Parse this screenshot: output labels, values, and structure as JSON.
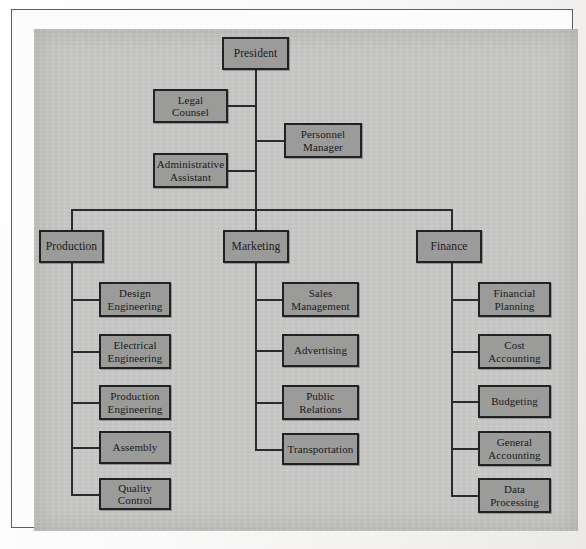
{
  "figure": {
    "kind": "organization-chart",
    "colors": {
      "page": "#f7f6f4",
      "frame_rule": "#5d5e60",
      "chart_field": "#c5c5c3",
      "node_fill": "#9b9b99",
      "node_border": "#222224",
      "connector": "#2b2b2d",
      "text": "#1a1a1c"
    }
  },
  "nodes": {
    "president": {
      "label": "President",
      "x": 221,
      "y": 36,
      "w": 67,
      "h": 33
    },
    "legal_counsel": {
      "label": "Legal\nCounsel",
      "x": 152,
      "y": 88,
      "w": 75,
      "h": 34
    },
    "personnel_manager": {
      "label": "Personnel\nManager",
      "x": 283,
      "y": 122,
      "w": 78,
      "h": 35
    },
    "administrative_assistant": {
      "label": "Administrative\nAssistant",
      "x": 152,
      "y": 152,
      "w": 75,
      "h": 35
    },
    "production": {
      "label": "Production",
      "x": 38,
      "y": 229,
      "w": 65,
      "h": 33
    },
    "marketing": {
      "label": "Marketing",
      "x": 222,
      "y": 229,
      "w": 66,
      "h": 33
    },
    "finance": {
      "label": "Finance",
      "x": 415,
      "y": 229,
      "w": 66,
      "h": 33
    },
    "design_engineering": {
      "label": "Design\nEngineering",
      "x": 98,
      "y": 281,
      "w": 72,
      "h": 35
    },
    "electrical_engineering": {
      "label": "Electrical\nEngineering",
      "x": 98,
      "y": 333,
      "w": 72,
      "h": 35
    },
    "production_engineering": {
      "label": "Production\nEngineering",
      "x": 98,
      "y": 384,
      "w": 72,
      "h": 35
    },
    "assembly": {
      "label": "Assembly",
      "x": 98,
      "y": 430,
      "w": 72,
      "h": 33
    },
    "quality_control": {
      "label": "Quality Control",
      "x": 98,
      "y": 477,
      "w": 72,
      "h": 32
    },
    "sales_management": {
      "label": "Sales\nManagement",
      "x": 281,
      "y": 281,
      "w": 77,
      "h": 35
    },
    "advertising": {
      "label": "Advertising",
      "x": 281,
      "y": 333,
      "w": 77,
      "h": 33
    },
    "public_relations": {
      "label": "Public\nRelations",
      "x": 281,
      "y": 384,
      "w": 77,
      "h": 35
    },
    "transportation": {
      "label": "Transportation",
      "x": 281,
      "y": 432,
      "w": 77,
      "h": 32
    },
    "financial_planning": {
      "label": "Financial\nPlanning",
      "x": 477,
      "y": 281,
      "w": 73,
      "h": 35
    },
    "cost_accounting": {
      "label": "Cost\nAccounting",
      "x": 477,
      "y": 333,
      "w": 73,
      "h": 35
    },
    "budgeting": {
      "label": "Budgeting",
      "x": 477,
      "y": 384,
      "w": 73,
      "h": 33
    },
    "general_accounting": {
      "label": "General\nAccounting",
      "x": 477,
      "y": 430,
      "w": 73,
      "h": 35
    },
    "data_processing": {
      "label": "Data\nProcessing",
      "x": 477,
      "y": 477,
      "w": 73,
      "h": 35
    }
  },
  "chart_data": {
    "type": "diagram",
    "diagram_type": "organization-chart",
    "title": "",
    "root": "President",
    "staff_positions": [
      "Legal Counsel",
      "Personnel Manager",
      "Administrative Assistant"
    ],
    "divisions": [
      {
        "name": "Production",
        "units": [
          "Design Engineering",
          "Electrical Engineering",
          "Production Engineering",
          "Assembly",
          "Quality Control"
        ]
      },
      {
        "name": "Marketing",
        "units": [
          "Sales Management",
          "Advertising",
          "Public Relations",
          "Transportation"
        ]
      },
      {
        "name": "Finance",
        "units": [
          "Financial Planning",
          "Cost Accounting",
          "Budgeting",
          "General Accounting",
          "Data Processing"
        ]
      }
    ],
    "edges": [
      [
        "President",
        "Legal Counsel"
      ],
      [
        "President",
        "Personnel Manager"
      ],
      [
        "President",
        "Administrative Assistant"
      ],
      [
        "President",
        "Production"
      ],
      [
        "President",
        "Marketing"
      ],
      [
        "President",
        "Finance"
      ],
      [
        "Production",
        "Design Engineering"
      ],
      [
        "Production",
        "Electrical Engineering"
      ],
      [
        "Production",
        "Production Engineering"
      ],
      [
        "Production",
        "Assembly"
      ],
      [
        "Production",
        "Quality Control"
      ],
      [
        "Marketing",
        "Sales Management"
      ],
      [
        "Marketing",
        "Advertising"
      ],
      [
        "Marketing",
        "Public Relations"
      ],
      [
        "Marketing",
        "Transportation"
      ],
      [
        "Finance",
        "Financial Planning"
      ],
      [
        "Finance",
        "Cost Accounting"
      ],
      [
        "Finance",
        "Budgeting"
      ],
      [
        "Finance",
        "General Accounting"
      ],
      [
        "Finance",
        "Data Processing"
      ]
    ],
    "levels": 3,
    "node_count": 21
  },
  "connectors": [
    {
      "name": "president-stem",
      "o": "v",
      "x": 254,
      "y": 69,
      "len": 139
    },
    {
      "name": "legal-counsel-link",
      "o": "h",
      "x": 226,
      "y": 104,
      "len": 29
    },
    {
      "name": "personnel-manager-link",
      "o": "h",
      "x": 254,
      "y": 139,
      "len": 30
    },
    {
      "name": "administrative-assistant-link",
      "o": "h",
      "x": 226,
      "y": 169,
      "len": 29
    },
    {
      "name": "division-bus",
      "o": "h",
      "x": 70,
      "y": 208,
      "len": 381
    },
    {
      "name": "production-drop",
      "o": "v",
      "x": 70,
      "y": 208,
      "len": 21
    },
    {
      "name": "marketing-drop",
      "o": "v",
      "x": 254,
      "y": 208,
      "len": 21
    },
    {
      "name": "finance-drop",
      "o": "v",
      "x": 450,
      "y": 208,
      "len": 21
    },
    {
      "name": "production-stem",
      "o": "v",
      "x": 70,
      "y": 262,
      "len": 232
    },
    {
      "name": "design-engineering-link",
      "o": "h",
      "x": 70,
      "y": 298,
      "len": 29
    },
    {
      "name": "electrical-engineering-link",
      "o": "h",
      "x": 70,
      "y": 350,
      "len": 29
    },
    {
      "name": "production-engineering-link",
      "o": "h",
      "x": 70,
      "y": 401,
      "len": 29
    },
    {
      "name": "assembly-link",
      "o": "h",
      "x": 70,
      "y": 446,
      "len": 29
    },
    {
      "name": "quality-control-link",
      "o": "h",
      "x": 70,
      "y": 493,
      "len": 29
    },
    {
      "name": "marketing-stem",
      "o": "v",
      "x": 254,
      "y": 262,
      "len": 187
    },
    {
      "name": "sales-management-link",
      "o": "h",
      "x": 254,
      "y": 298,
      "len": 28
    },
    {
      "name": "advertising-link",
      "o": "h",
      "x": 254,
      "y": 349,
      "len": 28
    },
    {
      "name": "public-relations-link",
      "o": "h",
      "x": 254,
      "y": 401,
      "len": 28
    },
    {
      "name": "transportation-link",
      "o": "h",
      "x": 254,
      "y": 448,
      "len": 28
    },
    {
      "name": "finance-stem",
      "o": "v",
      "x": 450,
      "y": 262,
      "len": 233
    },
    {
      "name": "financial-planning-link",
      "o": "h",
      "x": 450,
      "y": 298,
      "len": 28
    },
    {
      "name": "cost-accounting-link",
      "o": "h",
      "x": 450,
      "y": 350,
      "len": 28
    },
    {
      "name": "budgeting-link",
      "o": "h",
      "x": 450,
      "y": 400,
      "len": 28
    },
    {
      "name": "general-accounting-link",
      "o": "h",
      "x": 450,
      "y": 447,
      "len": 28
    },
    {
      "name": "data-processing-link",
      "o": "h",
      "x": 450,
      "y": 494,
      "len": 28
    }
  ]
}
